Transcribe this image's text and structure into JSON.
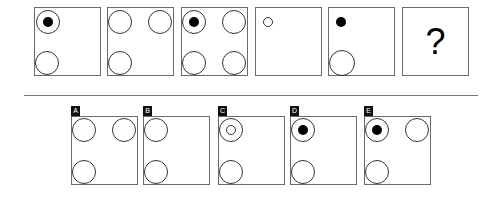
{
  "puzzle": {
    "sequence": [
      {
        "id": "1",
        "shapes": [
          {
            "type": "ring",
            "cx": 14,
            "cy": 15,
            "r": 12
          },
          {
            "type": "dot",
            "cx": 14,
            "cy": 15,
            "r": 5
          },
          {
            "type": "ring",
            "cx": 13,
            "cy": 56,
            "r": 12
          }
        ]
      },
      {
        "id": "2",
        "shapes": [
          {
            "type": "ring",
            "cx": 13,
            "cy": 15,
            "r": 12
          },
          {
            "type": "ring",
            "cx": 53,
            "cy": 15,
            "r": 12
          },
          {
            "type": "ring",
            "cx": 13,
            "cy": 56,
            "r": 12
          }
        ]
      },
      {
        "id": "3",
        "shapes": [
          {
            "type": "ring",
            "cx": 13,
            "cy": 15,
            "r": 12
          },
          {
            "type": "dot",
            "cx": 13,
            "cy": 15,
            "r": 5
          },
          {
            "type": "ring",
            "cx": 53,
            "cy": 15,
            "r": 12
          },
          {
            "type": "ring",
            "cx": 13,
            "cy": 56,
            "r": 12
          },
          {
            "type": "ring",
            "cx": 53,
            "cy": 56,
            "r": 12
          }
        ]
      },
      {
        "id": "4",
        "shapes": [
          {
            "type": "ring",
            "cx": 13,
            "cy": 15,
            "r": 5
          }
        ]
      },
      {
        "id": "5",
        "shapes": [
          {
            "type": "dot",
            "cx": 13,
            "cy": 15,
            "r": 5
          },
          {
            "type": "ring",
            "cx": 14,
            "cy": 56,
            "r": 13
          }
        ]
      },
      {
        "id": "6",
        "question": "?",
        "shapes": []
      }
    ],
    "options": [
      {
        "label": "A",
        "shapes": [
          {
            "type": "ring",
            "cx": 13,
            "cy": 14,
            "r": 12
          },
          {
            "type": "ring",
            "cx": 53,
            "cy": 14,
            "r": 12
          },
          {
            "type": "ring",
            "cx": 13,
            "cy": 56,
            "r": 12
          }
        ]
      },
      {
        "label": "B",
        "shapes": [
          {
            "type": "ring",
            "cx": 13,
            "cy": 14,
            "r": 12
          },
          {
            "type": "ring",
            "cx": 13,
            "cy": 56,
            "r": 12
          }
        ]
      },
      {
        "label": "C",
        "shapes": [
          {
            "type": "ring",
            "cx": 13,
            "cy": 14,
            "r": 12
          },
          {
            "type": "ring",
            "cx": 13,
            "cy": 14,
            "r": 5
          },
          {
            "type": "ring",
            "cx": 13,
            "cy": 56,
            "r": 12
          }
        ]
      },
      {
        "label": "D",
        "shapes": [
          {
            "type": "ring",
            "cx": 13,
            "cy": 14,
            "r": 12
          },
          {
            "type": "dot",
            "cx": 13,
            "cy": 14,
            "r": 5
          },
          {
            "type": "ring",
            "cx": 13,
            "cy": 56,
            "r": 12
          }
        ]
      },
      {
        "label": "E",
        "shapes": [
          {
            "type": "ring",
            "cx": 13,
            "cy": 14,
            "r": 12
          },
          {
            "type": "dot",
            "cx": 13,
            "cy": 14,
            "r": 5
          },
          {
            "type": "ring",
            "cx": 53,
            "cy": 14,
            "r": 12
          },
          {
            "type": "ring",
            "cx": 13,
            "cy": 56,
            "r": 12
          }
        ]
      }
    ]
  },
  "colors": {
    "border": "#6a6a6a",
    "ring": "#333333",
    "dot": "#000000",
    "label_bg": "#111111",
    "label_text": "#ffffff",
    "divider": "#777777"
  }
}
